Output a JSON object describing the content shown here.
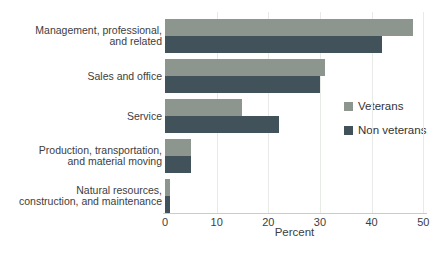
{
  "chart_data": {
    "type": "bar",
    "orientation": "horizontal",
    "title": "",
    "xlabel": "Percent",
    "xlim": [
      0,
      50
    ],
    "xticks": [
      0,
      10,
      20,
      30,
      40,
      50
    ],
    "grid": true,
    "legend_position": "right",
    "categories": [
      "Management, professional, and related",
      "Sales and office",
      "Service",
      "Production, transportation, and material moving",
      "Natural resources, construction, and maintenance"
    ],
    "category_label_lines": [
      [
        "Management, professional,",
        "and related"
      ],
      [
        "Sales and office"
      ],
      [
        "Service"
      ],
      [
        "Production, transportation,",
        "and material moving"
      ],
      [
        "Natural resources,",
        "construction, and maintenance"
      ]
    ],
    "series": [
      {
        "name": "Veterans",
        "color": "#8c968e",
        "values": [
          48,
          31,
          15,
          5,
          1
        ]
      },
      {
        "name": "Non veterans",
        "color": "#42525a",
        "values": [
          42,
          30,
          22,
          5,
          1
        ]
      }
    ]
  }
}
